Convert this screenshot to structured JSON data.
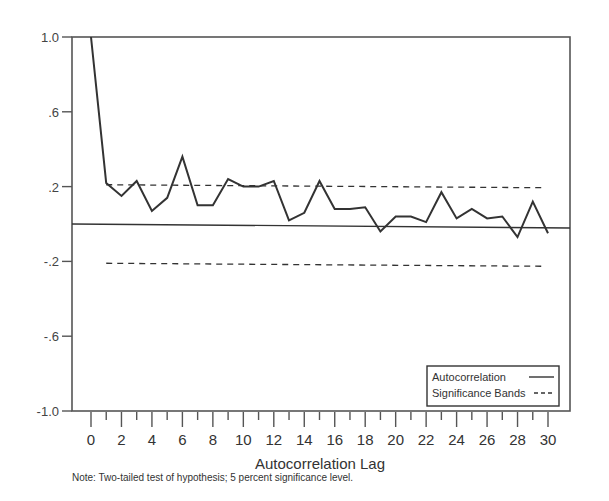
{
  "chart_data": {
    "type": "line",
    "title": "",
    "xlabel": "Autocorrelation Lag",
    "ylabel": "",
    "xlim": [
      0,
      30
    ],
    "ylim": [
      -1.0,
      1.0
    ],
    "grid": false,
    "y_ticks": [
      1.0,
      0.6,
      0.2,
      -0.2,
      -0.6,
      -1.0
    ],
    "y_tick_labels": [
      "1.0",
      ".6",
      ".2",
      "-.2",
      "-.6",
      "-1.0"
    ],
    "x_ticks": [
      0,
      2,
      4,
      6,
      8,
      10,
      12,
      14,
      16,
      18,
      20,
      22,
      24,
      26,
      28,
      30
    ],
    "x_tick_labels": [
      "0",
      "2",
      "4",
      "6",
      "8",
      "10",
      "12",
      "14",
      "16",
      "18",
      "20",
      "22",
      "24",
      "26",
      "28",
      "30"
    ],
    "x": [
      0,
      1,
      2,
      3,
      4,
      5,
      6,
      7,
      8,
      9,
      10,
      11,
      12,
      13,
      14,
      15,
      16,
      17,
      18,
      19,
      20,
      21,
      22,
      23,
      24,
      25,
      26,
      27,
      28,
      29,
      30
    ],
    "series": [
      {
        "name": "Autocorrelation",
        "style": "solid",
        "values": [
          1.0,
          0.22,
          0.15,
          0.23,
          0.07,
          0.14,
          0.36,
          0.1,
          0.1,
          0.24,
          0.2,
          0.2,
          0.23,
          0.02,
          0.06,
          0.23,
          0.08,
          0.08,
          0.09,
          -0.04,
          0.04,
          0.04,
          0.01,
          0.17,
          0.03,
          0.08,
          0.03,
          0.04,
          -0.07,
          0.12,
          -0.05
        ]
      },
      {
        "name": "Significance Bands",
        "style": "dashed",
        "upper": 0.21,
        "lower": -0.21,
        "x_range": [
          1,
          30
        ]
      }
    ],
    "reference_line": {
      "y": 0.0,
      "style": "solid"
    },
    "legend": {
      "position": "lower right",
      "entries": [
        {
          "label": "Autocorrelation",
          "style": "solid"
        },
        {
          "label": "Significance Bands",
          "style": "dashed"
        }
      ]
    },
    "note": "Note: Two-tailed test of hypothesis; 5 percent significance level."
  },
  "colors": {
    "line": "#333333",
    "axis": "#555555",
    "background": "#ffffff"
  }
}
